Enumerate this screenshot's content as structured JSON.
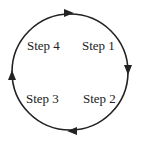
{
  "diagram": {
    "type": "cycle",
    "direction": "clockwise",
    "steps": [
      {
        "label": "Step 1",
        "position": "upper-right"
      },
      {
        "label": "Step 2",
        "position": "lower-right"
      },
      {
        "label": "Step 3",
        "position": "lower-left"
      },
      {
        "label": "Step 4",
        "position": "upper-left"
      }
    ],
    "colors": {
      "stroke": "#222222",
      "background": "#ffffff"
    }
  }
}
